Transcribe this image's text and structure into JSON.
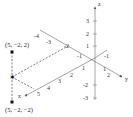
{
  "diagram": {
    "type": "3d-coordinate-axes",
    "axes": {
      "x": {
        "label": "x",
        "ticks": [
          "1",
          "2",
          "3",
          "4",
          "5"
        ]
      },
      "y": {
        "label": "y",
        "ticks": [
          "1",
          "2"
        ],
        "negative_ticks": [
          "-1",
          "-2",
          "-3",
          "-4"
        ]
      },
      "z": {
        "label": "z",
        "ticks": [
          "1",
          "2",
          "3"
        ],
        "negative_ticks": [
          "-2",
          "-3"
        ]
      }
    },
    "points": [
      {
        "label": "(5, −2, 2)",
        "coords": [
          5,
          -2,
          2
        ]
      },
      {
        "label": "(5, −2, −2)",
        "coords": [
          5,
          -2,
          -2
        ]
      },
      {
        "label": "",
        "coords": [
          5,
          -2,
          0
        ],
        "marker": "star"
      }
    ],
    "colors": {
      "axis": "#555555",
      "dashed": "#444444",
      "point": "#111111"
    }
  }
}
